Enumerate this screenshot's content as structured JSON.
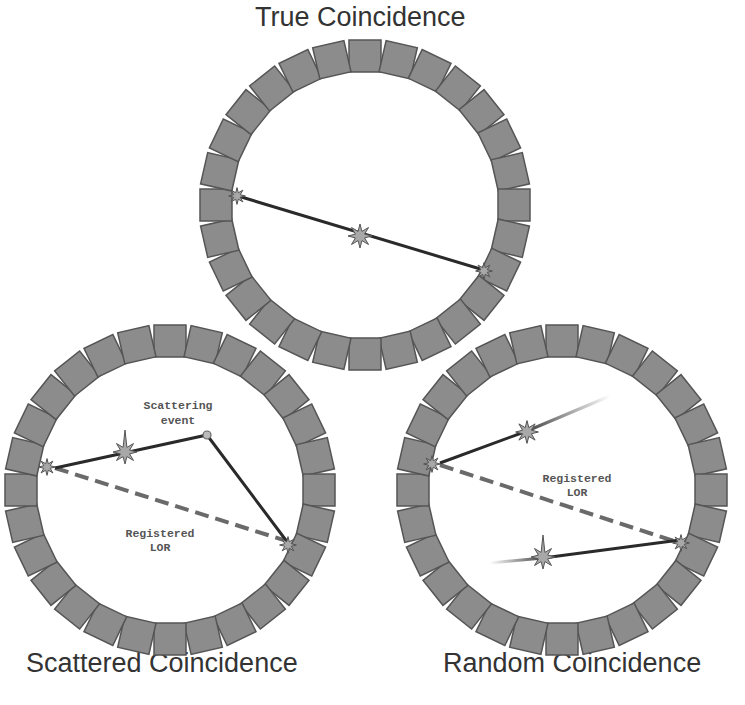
{
  "titles": {
    "true": "True Coincidence",
    "scattered": "Scattered Coincidence",
    "random": "Random Coincidence"
  },
  "annotations": {
    "scattering_event_line1": "Scattering",
    "scattering_event_line2": "event",
    "registered_lor_line1": "Registered",
    "registered_lor_line2": "LOR"
  },
  "colors": {
    "detector_fill": "#8c8c8c",
    "detector_stroke": "#555555",
    "line": "#2a2a2a",
    "lor_dashed": "#6a6a6a",
    "star_fill": "#a8a8a8"
  },
  "rings": [
    {
      "name": "true-coincidence-ring",
      "cx": 365,
      "cy": 205,
      "r": 133,
      "detectors": 28
    },
    {
      "name": "scattered-coincidence-ring",
      "cx": 170,
      "cy": 490,
      "r": 133,
      "detectors": 28
    },
    {
      "name": "random-coincidence-ring",
      "cx": 562,
      "cy": 490,
      "r": 133,
      "detectors": 28
    }
  ]
}
